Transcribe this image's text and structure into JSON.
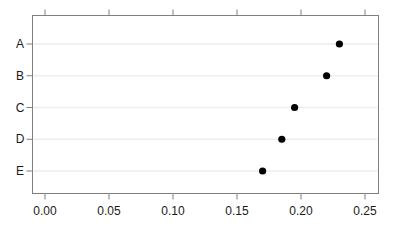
{
  "chart_data": {
    "type": "scatter",
    "subtype": "cleveland-dot-plot",
    "title": "",
    "xlabel": "",
    "ylabel": "",
    "categories": [
      "A",
      "B",
      "C",
      "D",
      "E"
    ],
    "values": [
      0.23,
      0.22,
      0.195,
      0.185,
      0.17
    ],
    "xlim": [
      0,
      0.25
    ],
    "xticks": [
      0,
      0.05,
      0.1,
      0.15,
      0.2,
      0.25
    ],
    "xtick_labels": [
      "0.00",
      "0.05",
      "0.10",
      "0.15",
      "0.20",
      "0.25"
    ],
    "grid": "horizontal line per category",
    "legend": "none",
    "axis_sides_with_ticks": [
      "bottom",
      "top",
      "left"
    ],
    "colors": {
      "point": "#000000",
      "axis_box": "#7f7f7f",
      "tick": "#7f7f7f",
      "tick_label": "#1a1a1a",
      "category_label": "#1a1a1a",
      "gridline": "#ededed",
      "background": "#ffffff"
    }
  }
}
